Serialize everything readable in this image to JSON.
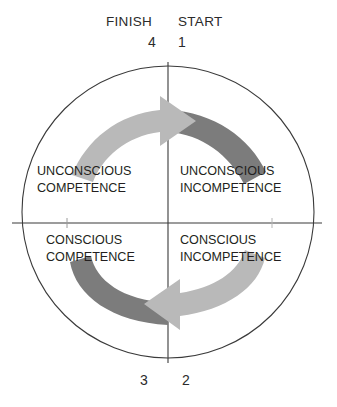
{
  "diagram": {
    "header": {
      "finish_label": "FINISH",
      "start_label": "START"
    },
    "step_numbers": {
      "top_left": "4",
      "top_right": "1",
      "bottom_left": "3",
      "bottom_right": "2"
    },
    "quadrants": [
      {
        "id": "unconscious-incompetence",
        "position": "top-right",
        "step": "1",
        "line1": "UNCONSCIOUS",
        "line2": "INCOMPETENCE"
      },
      {
        "id": "conscious-incompetence",
        "position": "bottom-right",
        "step": "2",
        "line1": "CONSCIOUS",
        "line2": "INCOMPETENCE"
      },
      {
        "id": "conscious-competence",
        "position": "bottom-left",
        "step": "3",
        "line1": "CONSCIOUS",
        "line2": "COMPETENCE"
      },
      {
        "id": "unconscious-competence",
        "position": "top-left",
        "step": "4",
        "line1": "UNCONSCIOUS",
        "line2": "COMPETENCE"
      }
    ],
    "colors": {
      "outline": "#3a3a3a",
      "arrow_dark": "#7c7c7c",
      "arrow_light": "#b9b9b9",
      "text": "#231f20",
      "background": "#ffffff"
    }
  }
}
